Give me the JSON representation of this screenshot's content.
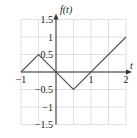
{
  "chart_data": {
    "type": "line",
    "title": "",
    "xlabel": "t",
    "ylabel": "f(t)",
    "xlim": [
      -1,
      2
    ],
    "ylim": [
      -1.5,
      1.5
    ],
    "grid": true,
    "grid_step": {
      "x": 0.5,
      "y": 0.5
    },
    "x_ticks": [
      -1,
      1,
      2
    ],
    "x_tick_labels": [
      "−1",
      "1",
      "2"
    ],
    "y_ticks": [
      1.5,
      1,
      0.5,
      -0.5,
      -1,
      -1.5
    ],
    "y_tick_labels": [
      "1.5",
      "1",
      "0.5",
      "−0.5",
      "−1",
      "−1.5"
    ],
    "series": [
      {
        "name": "f(t)",
        "x": [
          -1,
          -0.5,
          0.5,
          2
        ],
        "y": [
          0,
          0.5,
          -0.5,
          1
        ]
      }
    ],
    "colors": {
      "line": "#555555",
      "grid": "#d9d9d9",
      "axis": "#333333"
    }
  }
}
